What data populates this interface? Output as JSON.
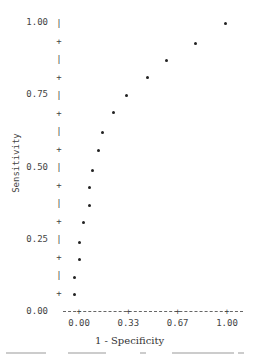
{
  "chart_data": {
    "type": "scatter",
    "title": "",
    "xlabel": "1 - Specificity",
    "ylabel": "Sensitivity",
    "xlim": [
      -0.1,
      1.1
    ],
    "ylim": [
      0,
      1
    ],
    "grid": false,
    "x_ticks": [
      "0.00",
      "0.33",
      "0.67",
      "1.00"
    ],
    "y_ticks": [
      "0.00",
      "0.25",
      "0.50",
      "0.75",
      "1.00"
    ],
    "y_tick_markers": [
      "|",
      "+",
      "|",
      "+"
    ],
    "series": [
      {
        "name": "ROC points",
        "points": [
          {
            "x": -0.03,
            "y": 0.06
          },
          {
            "x": -0.03,
            "y": 0.12
          },
          {
            "x": 0.0,
            "y": 0.18
          },
          {
            "x": 0.0,
            "y": 0.24
          },
          {
            "x": 0.03,
            "y": 0.31
          },
          {
            "x": 0.07,
            "y": 0.37
          },
          {
            "x": 0.07,
            "y": 0.43
          },
          {
            "x": 0.09,
            "y": 0.49
          },
          {
            "x": 0.13,
            "y": 0.56
          },
          {
            "x": 0.16,
            "y": 0.62
          },
          {
            "x": 0.23,
            "y": 0.69
          },
          {
            "x": 0.32,
            "y": 0.75
          },
          {
            "x": 0.46,
            "y": 0.81
          },
          {
            "x": 0.59,
            "y": 0.87
          },
          {
            "x": 0.79,
            "y": 0.93
          },
          {
            "x": 0.99,
            "y": 1.0
          }
        ]
      }
    ]
  },
  "layout": {
    "plot_px": {
      "x0": 79,
      "x1": 227,
      "y0": 312,
      "y1": 23
    },
    "dot_color": "#222222",
    "axis_color": "#666666"
  }
}
